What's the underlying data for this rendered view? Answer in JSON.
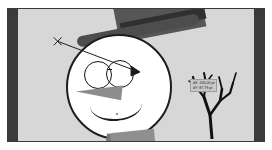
{
  "app": {
    "type": "vector-graphics-editor-canvas",
    "artwork_title": "Snowman illustration"
  },
  "canvas": {
    "background_color": "#d7d7d7",
    "page_bar_color": "#3b3b3b",
    "frame_border_color": "#3a3a3a",
    "guide_color": "#b7b7b7"
  },
  "artwork": {
    "label": "snowman",
    "parts": [
      {
        "name": "top-hat",
        "color": "#565656"
      },
      {
        "name": "hat-brim",
        "color": "#4d4d4d"
      },
      {
        "name": "hat-band",
        "color": "#303030"
      },
      {
        "name": "head",
        "color": "#ffffff"
      },
      {
        "name": "spectacles",
        "color": "#141414"
      },
      {
        "name": "carrot-nose",
        "color": "#8d8d8d"
      },
      {
        "name": "smile",
        "color": "#1d1d1d"
      },
      {
        "name": "scarf",
        "color": "#8f8f8f"
      },
      {
        "name": "bare-branch",
        "color": "#111111"
      }
    ]
  },
  "measure": {
    "start_marker": "X",
    "stroke_color": "#1b1b1b",
    "arrow_label": "move-vector"
  },
  "tooltip": {
    "line1": "dX: 206.00 pt",
    "line2": "dY: 87.79 pt",
    "background": "#c9c9c9",
    "border": "#9d9d9d",
    "text_color": "#1b1b1b"
  }
}
